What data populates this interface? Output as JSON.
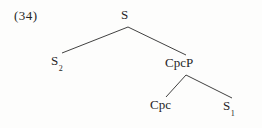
{
  "figure": {
    "example_number": "(34)",
    "background_color": "#fdfdfc",
    "line_color": "#2b2b2b",
    "text_color": "#262626",
    "type": "syntax-tree"
  },
  "tree": {
    "root": {
      "label": "S",
      "base": "S",
      "subscript": ""
    },
    "left_child": {
      "label": "S2",
      "base": "S",
      "subscript": "2"
    },
    "right_child": {
      "label": "CpcP",
      "base": "CpcP",
      "subscript": ""
    },
    "right_left_child": {
      "label": "Cpc",
      "base": "Cpc",
      "subscript": ""
    },
    "right_right_child": {
      "label": "S1",
      "base": "S",
      "subscript": "1"
    }
  }
}
